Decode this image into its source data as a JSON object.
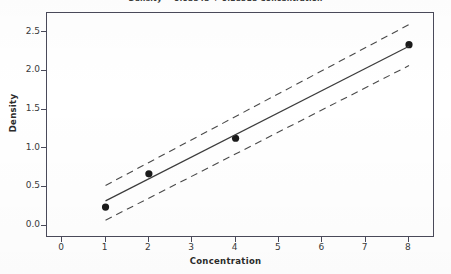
{
  "chart_data": {
    "type": "scatter",
    "title": "Density  =  0.03543  +  0.28518 Concentration",
    "xlabel": "Concentration",
    "ylabel": "Density",
    "xlim": [
      -0.35,
      8.6
    ],
    "ylim": [
      -0.16,
      2.75
    ],
    "grid": false,
    "legend": null,
    "xticks": [
      0,
      1,
      2,
      3,
      4,
      5,
      6,
      7,
      8
    ],
    "xtick_labels": [
      "0",
      "1",
      "2",
      "3",
      "4",
      "5",
      "6",
      "7",
      "8"
    ],
    "yticks": [
      0.0,
      0.5,
      1.0,
      1.5,
      2.0,
      2.5
    ],
    "ytick_labels": [
      "0.0",
      "0.5",
      "1.0",
      "1.5",
      "2.0",
      "2.5"
    ],
    "series": [
      {
        "name": "Observed data",
        "type": "scatter",
        "marker": "filled-circle",
        "color": "#1a1a1a",
        "x": [
          1,
          2,
          4,
          8
        ],
        "y": [
          0.24,
          0.67,
          1.13,
          2.34
        ]
      },
      {
        "name": "Fitted regression line",
        "type": "line",
        "style": "solid",
        "color": "#3c3c3c",
        "x": [
          1,
          8
        ],
        "y": [
          0.32,
          2.32
        ]
      },
      {
        "name": "Upper confidence band",
        "type": "line",
        "style": "dashed",
        "color": "#4a4a4a",
        "x": [
          1,
          8
        ],
        "y": [
          0.52,
          2.6
        ]
      },
      {
        "name": "Lower confidence band",
        "type": "line",
        "style": "dashed",
        "color": "#4a4a4a",
        "x": [
          1,
          8
        ],
        "y": [
          0.07,
          2.07
        ]
      }
    ],
    "regression": {
      "intercept": 0.03543,
      "slope": 0.28518,
      "equation": "Density  =  0.03543  +  0.28518 Concentration"
    },
    "colors": {
      "axis": "#4a4a5a",
      "text": "#2b2b2b",
      "marker": "#1a1a1a",
      "fit_line": "#3c3c3c",
      "band_line": "#4a4a4a",
      "background": "#ffffff"
    }
  }
}
